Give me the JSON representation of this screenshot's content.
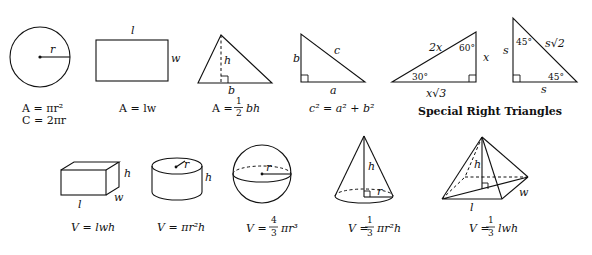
{
  "figures": {
    "circle": {
      "label_r": "r",
      "formula_area": "A = πr²",
      "formula_circumference": "C = 2πr"
    },
    "rectangle": {
      "label_l": "l",
      "label_w": "w",
      "formula_area": "A = lw"
    },
    "triangle": {
      "label_h": "h",
      "label_b": "b",
      "formula_area_lhs": "A =",
      "formula_frac_num": "1",
      "formula_frac_den": "2",
      "formula_area_rhs": "bh"
    },
    "right_triangle": {
      "label_a": "a",
      "label_b": "b",
      "label_c": "c",
      "formula_pythagorean": "c² = a² + b²"
    },
    "triangle_30_60_90": {
      "label_hyp": "2x",
      "label_short": "x",
      "label_long": "x√3",
      "angle_60": "60°",
      "angle_30": "30°"
    },
    "triangle_45_45_90": {
      "label_leg_vertical": "s",
      "label_leg_horizontal": "s",
      "label_hyp": "s√2",
      "angle_top": "45°",
      "angle_bottom": "45°"
    },
    "special_right_triangles_caption": "Special Right Triangles",
    "rectangular_prism": {
      "label_l": "l",
      "label_w": "w",
      "label_h": "h",
      "formula_volume": "V = lwh"
    },
    "cylinder": {
      "label_r": "r",
      "label_h": "h",
      "formula_volume": "V = πr²h"
    },
    "sphere": {
      "label_r": "r",
      "formula_lhs": "V =",
      "formula_frac_num": "4",
      "formula_frac_den": "3",
      "formula_rhs": "πr³"
    },
    "cone": {
      "label_h": "h",
      "label_r": "r",
      "formula_lhs": "V =",
      "formula_frac_num": "1",
      "formula_frac_den": "3",
      "formula_rhs": "πr²h"
    },
    "pyramid": {
      "label_h": "h",
      "label_l": "l",
      "label_w": "w",
      "formula_lhs": "V =",
      "formula_frac_num": "1",
      "formula_frac_den": "3",
      "formula_rhs": "lwh"
    }
  }
}
